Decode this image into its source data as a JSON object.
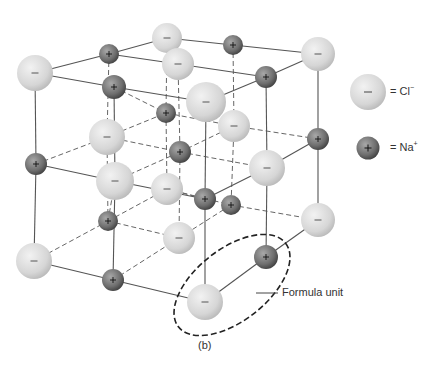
{
  "figure": {
    "caption": "(b)",
    "formula_unit_label": "Formula unit"
  },
  "legend": {
    "items": [
      {
        "ion": "Cl",
        "charge": "−",
        "text": "= Cl",
        "superscript": "−",
        "sign": "−",
        "kind": "chloride"
      },
      {
        "ion": "Na",
        "charge": "+",
        "text": "= Na",
        "superscript": "+",
        "sign": "+",
        "kind": "sodium"
      }
    ]
  },
  "colors": {
    "chloride_light": "#e8e8e8",
    "chloride_dark": "#bdbdbd",
    "sodium_light": "#9a9a9a",
    "sodium_dark": "#4a4a4a",
    "bond_line": "#555555",
    "dashed_line": "#666666",
    "ellipse": "#222222"
  },
  "lattice": {
    "chloride_ions": [
      {
        "x": 35,
        "y": 73,
        "r": 18
      },
      {
        "x": 167,
        "y": 38,
        "r": 15
      },
      {
        "x": 178,
        "y": 64,
        "r": 16
      },
      {
        "x": 206,
        "y": 102,
        "r": 20
      },
      {
        "x": 107,
        "y": 137,
        "r": 18
      },
      {
        "x": 234,
        "y": 126,
        "r": 16
      },
      {
        "x": 115,
        "y": 181,
        "r": 19
      },
      {
        "x": 167,
        "y": 189,
        "r": 16
      },
      {
        "x": 267,
        "y": 168,
        "r": 18
      },
      {
        "x": 318,
        "y": 54,
        "r": 17
      },
      {
        "x": 179,
        "y": 238,
        "r": 16
      },
      {
        "x": 34,
        "y": 261,
        "r": 18
      },
      {
        "x": 318,
        "y": 220,
        "r": 17
      },
      {
        "x": 205,
        "y": 302,
        "r": 18
      }
    ],
    "sodium_ions": [
      {
        "x": 109,
        "y": 54,
        "r": 10
      },
      {
        "x": 233,
        "y": 45,
        "r": 10
      },
      {
        "x": 114,
        "y": 87,
        "r": 12
      },
      {
        "x": 266,
        "y": 77,
        "r": 11
      },
      {
        "x": 166,
        "y": 113,
        "r": 10
      },
      {
        "x": 180,
        "y": 152,
        "r": 11
      },
      {
        "x": 36,
        "y": 164,
        "r": 11
      },
      {
        "x": 318,
        "y": 139,
        "r": 11
      },
      {
        "x": 205,
        "y": 199,
        "r": 11
      },
      {
        "x": 231,
        "y": 205,
        "r": 10
      },
      {
        "x": 108,
        "y": 221,
        "r": 10
      },
      {
        "x": 266,
        "y": 257,
        "r": 12
      },
      {
        "x": 113,
        "y": 280,
        "r": 11
      }
    ],
    "solid_bonds": [
      [
        35,
        73,
        109,
        54
      ],
      [
        35,
        73,
        114,
        87
      ],
      [
        109,
        54,
        167,
        38
      ],
      [
        167,
        38,
        233,
        45
      ],
      [
        233,
        45,
        318,
        54
      ],
      [
        114,
        87,
        206,
        102
      ],
      [
        178,
        64,
        266,
        77
      ],
      [
        266,
        77,
        318,
        54
      ],
      [
        109,
        54,
        178,
        64
      ],
      [
        206,
        102,
        266,
        77
      ],
      [
        35,
        73,
        36,
        164
      ],
      [
        36,
        164,
        34,
        261
      ],
      [
        114,
        87,
        115,
        181
      ],
      [
        115,
        181,
        113,
        280
      ],
      [
        206,
        102,
        205,
        199
      ],
      [
        205,
        199,
        205,
        302
      ],
      [
        318,
        54,
        318,
        139
      ],
      [
        318,
        139,
        318,
        220
      ],
      [
        266,
        77,
        267,
        168
      ],
      [
        267,
        168,
        266,
        257
      ],
      [
        34,
        261,
        113,
        280
      ],
      [
        113,
        280,
        205,
        302
      ],
      [
        205,
        302,
        266,
        257
      ],
      [
        266,
        257,
        318,
        220
      ],
      [
        36,
        164,
        115,
        181
      ],
      [
        115,
        181,
        205,
        199
      ],
      [
        205,
        199,
        267,
        168
      ],
      [
        267,
        168,
        318,
        139
      ]
    ],
    "dashed_bonds": [
      [
        109,
        54,
        107,
        137
      ],
      [
        107,
        137,
        108,
        221
      ],
      [
        233,
        45,
        234,
        126
      ],
      [
        234,
        126,
        231,
        205
      ],
      [
        167,
        38,
        166,
        113
      ],
      [
        166,
        113,
        167,
        189
      ],
      [
        178,
        64,
        180,
        152
      ],
      [
        180,
        152,
        179,
        238
      ],
      [
        36,
        164,
        107,
        137
      ],
      [
        107,
        137,
        166,
        113
      ],
      [
        166,
        113,
        234,
        126
      ],
      [
        234,
        126,
        318,
        139
      ],
      [
        34,
        261,
        108,
        221
      ],
      [
        108,
        221,
        179,
        238
      ],
      [
        179,
        238,
        231,
        205
      ],
      [
        231,
        205,
        318,
        220
      ],
      [
        114,
        87,
        166,
        113
      ],
      [
        115,
        181,
        180,
        152
      ],
      [
        180,
        152,
        234,
        126
      ],
      [
        107,
        137,
        180,
        152
      ],
      [
        180,
        152,
        267,
        168
      ],
      [
        108,
        221,
        167,
        189
      ],
      [
        167,
        189,
        231,
        205
      ],
      [
        113,
        280,
        179,
        238
      ],
      [
        167,
        189,
        205,
        199
      ],
      [
        108,
        221,
        115,
        181
      ]
    ]
  },
  "formula_unit": {
    "ellipse": {
      "cx": 232,
      "cy": 285,
      "rx": 68,
      "ry": 36,
      "rotate": -38
    },
    "leader": [
      256,
      293,
      278,
      293
    ],
    "label_x": 282,
    "label_y": 286
  }
}
